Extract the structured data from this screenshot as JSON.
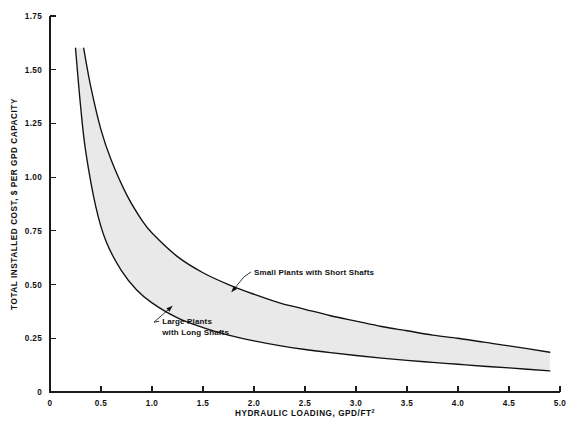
{
  "chart_data": {
    "type": "area",
    "title": "",
    "xlabel": "HYDRAULIC LOADING, GPD/FT",
    "xlabel_sup": "2",
    "ylabel": "TOTAL INSTALLED COST, $ PER GPD CAPACITY",
    "xlim": [
      0,
      5.0
    ],
    "ylim": [
      0,
      1.75
    ],
    "grid": false,
    "legend": "none",
    "xticks": [
      0,
      0.5,
      1.0,
      1.5,
      2.0,
      2.5,
      3.0,
      3.5,
      4.0,
      4.5,
      5.0
    ],
    "xtick_labels": [
      "0",
      "0.5",
      "1.0",
      "1.5",
      "2.0",
      "2.5",
      "3.0",
      "3.5",
      "4.0",
      "4.5",
      "5.0"
    ],
    "yticks": [
      0,
      0.25,
      0.5,
      0.75,
      1.0,
      1.25,
      1.5,
      1.75
    ],
    "ytick_labels": [
      "0",
      "0.25",
      "0.50",
      "0.75",
      "1.00",
      "1.25",
      "1.50",
      "1.75"
    ],
    "band_fill_color": "#e9e9e9",
    "line_color": "#111111",
    "series": [
      {
        "name": "Small Plants with Short Shafts",
        "role": "upper-bound",
        "x": [
          0.33,
          0.4,
          0.5,
          0.6,
          0.75,
          0.9,
          1.0,
          1.25,
          1.5,
          1.75,
          2.0,
          2.25,
          2.5,
          2.75,
          3.0,
          3.25,
          3.5,
          3.75,
          4.0,
          4.25,
          4.5,
          4.9
        ],
        "y": [
          1.6,
          1.42,
          1.22,
          1.08,
          0.92,
          0.8,
          0.74,
          0.63,
          0.555,
          0.5,
          0.455,
          0.415,
          0.385,
          0.355,
          0.33,
          0.305,
          0.285,
          0.265,
          0.25,
          0.232,
          0.215,
          0.185
        ]
      },
      {
        "name": "Large Plants with Long Shafts",
        "role": "lower-bound",
        "x": [
          0.25,
          0.3,
          0.35,
          0.45,
          0.55,
          0.7,
          0.85,
          1.0,
          1.25,
          1.5,
          1.75,
          2.0,
          2.25,
          2.5,
          2.75,
          3.0,
          3.25,
          3.5,
          3.75,
          4.0,
          4.25,
          4.5,
          4.9
        ],
        "y": [
          1.6,
          1.33,
          1.12,
          0.86,
          0.7,
          0.565,
          0.475,
          0.415,
          0.345,
          0.3,
          0.265,
          0.238,
          0.216,
          0.198,
          0.183,
          0.17,
          0.158,
          0.147,
          0.138,
          0.129,
          0.12,
          0.112,
          0.098
        ]
      }
    ],
    "annotations": [
      {
        "id": "upper-annotation",
        "lines": [
          "Small Plants with Short Shafts"
        ],
        "text_x": 2.0,
        "text_y": 0.545,
        "arrow_from_x": 1.9,
        "arrow_from_y": 0.535,
        "arrow_to_x": 1.78,
        "arrow_to_y": 0.465
      },
      {
        "id": "lower-annotation",
        "lines": [
          "Large Plants",
          "with Long Shafts"
        ],
        "text_x": 1.1,
        "text_y": 0.315,
        "arrow_from_x": 1.02,
        "arrow_from_y": 0.325,
        "arrow_to_x": 1.2,
        "arrow_to_y": 0.4
      }
    ]
  }
}
